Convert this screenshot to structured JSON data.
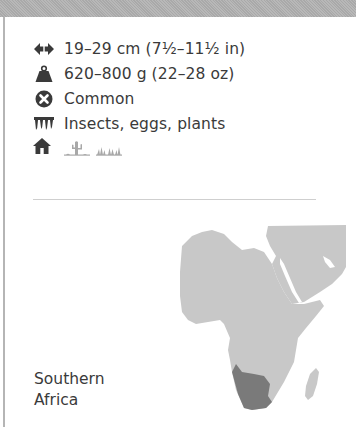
{
  "facts": {
    "size": {
      "icon": "double-arrow-icon",
      "text": "19–29 cm (7½–11½ in)"
    },
    "weight": {
      "icon": "weight-icon",
      "text": "620–800 g (22–28 oz)"
    },
    "status": {
      "icon": "circle-x-icon",
      "text": "Common"
    },
    "diet": {
      "icon": "teeth-icon",
      "text": "Insects, eggs, plants"
    },
    "habitat": {
      "icons": [
        "house-icon",
        "desert-cactus-icon",
        "grassland-icon"
      ]
    }
  },
  "map": {
    "region_label_line1": "Southern",
    "region_label_line2": "Africa",
    "land_color": "#c8c8c8",
    "range_color": "#7a7a7a"
  }
}
